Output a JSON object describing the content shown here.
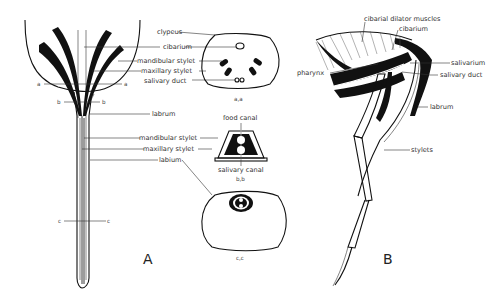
{
  "figure": {
    "panels": {
      "A": {
        "letter": "A",
        "labels": {
          "clypeus": "clypeus",
          "cibarium": "cibarium",
          "mandibular_stylet": "mandibular stylet",
          "maxillary_stylet": "maxillary stylet",
          "salivary_duct": "salivary duct",
          "labrum": "labrum",
          "mandibular_stylet_2": "mandibular stylet",
          "maxillary_stylet_2": "maxillary stylet",
          "labium": "labium",
          "food_canal": "food canal",
          "salivary_canal": "salivary canal"
        },
        "section_marks": {
          "a_left": "a",
          "a_right": "a",
          "b_left": "b",
          "b_right": "b",
          "c_left": "c",
          "c_right": "c"
        },
        "section_captions": {
          "aa": "a,a",
          "bb": "b,b",
          "cc": "c,c"
        }
      },
      "B": {
        "letter": "B",
        "labels": {
          "cibarial_dilator_muscles": "cibarial dilator muscles",
          "cibarium": "cibarium",
          "pharynx": "pharynx",
          "salivarium": "salivarium",
          "salivary_duct": "salivary duct",
          "labrum": "labrum",
          "stylets": "stylets"
        }
      }
    }
  }
}
